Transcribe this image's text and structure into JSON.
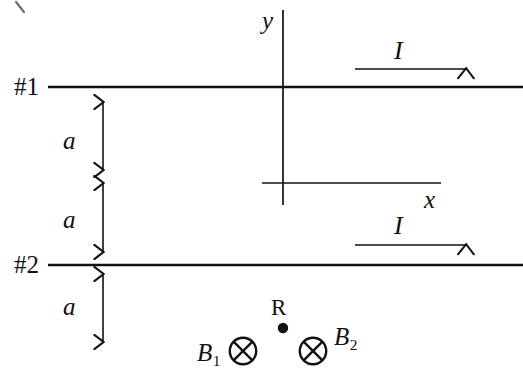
{
  "figure": {
    "type": "physics-diagram",
    "background_color": "#ffffff",
    "ink_color": "#111111",
    "width": 523,
    "height": 388
  },
  "wires": [
    {
      "id": "wire-1",
      "tag": "#1",
      "current_label": "I",
      "current_direction": "right",
      "y": 87
    },
    {
      "id": "wire-2",
      "tag": "#2",
      "current_label": "I",
      "current_direction": "right",
      "y": 265
    }
  ],
  "dimensions": [
    {
      "id": "gap-1",
      "label": "a",
      "from_y": 96,
      "to_y": 176
    },
    {
      "id": "gap-2",
      "label": "a",
      "from_y": 177,
      "to_y": 258
    },
    {
      "id": "gap-3",
      "label": "a",
      "from_y": 270,
      "to_y": 348
    }
  ],
  "axes": {
    "origin_x": 283,
    "origin_y": 183,
    "y_axis": {
      "label": "y",
      "top": 10,
      "bottom": 205
    },
    "x_axis": {
      "label": "x",
      "left": 262,
      "right": 441
    }
  },
  "field_point": {
    "label": "R",
    "marker": "filled-dot",
    "x": 283,
    "y": 328
  },
  "field_vectors": [
    {
      "id": "b1",
      "label": "B",
      "subscript": "1",
      "symbol": "into-page-cross-circle",
      "x": 243,
      "y": 351
    },
    {
      "id": "b2",
      "label": "B",
      "subscript": "2",
      "symbol": "into-page-cross-circle",
      "x": 313,
      "y": 351
    }
  ],
  "labels": {
    "wire1_tag": "#1",
    "wire2_tag": "#2",
    "a1": "a",
    "a2": "a",
    "a3": "a",
    "y_axis": "y",
    "x_axis": "x",
    "current1": "I",
    "current2": "I",
    "field_point": "R",
    "b1_base": "B",
    "b1_sub": "1",
    "b2_base": "B",
    "b2_sub": "2"
  }
}
